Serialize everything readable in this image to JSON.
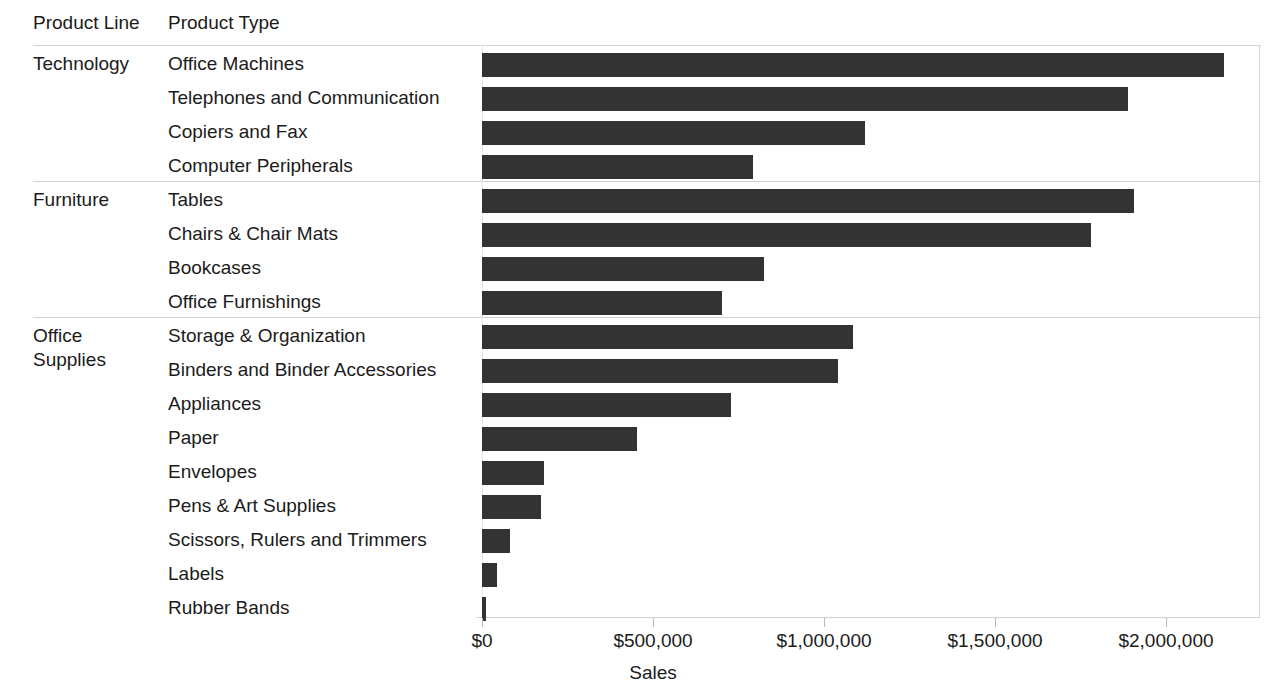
{
  "headers": {
    "product_line": "Product Line",
    "product_type": "Product Type"
  },
  "axis": {
    "title": "Sales",
    "ticks": [
      "$0",
      "$500,000",
      "$1,000,000",
      "$1,500,000",
      "$2,000,000"
    ],
    "tick_values": [
      0,
      500000,
      1000000,
      1500000,
      2000000
    ]
  },
  "colors": {
    "bar": "#333333",
    "rule": "#d4d4d4",
    "text": "#1b1b1b"
  },
  "groups": [
    {
      "name": "Technology",
      "rows": [
        {
          "label": "Office Machines",
          "value": 2170000
        },
        {
          "label": "Telephones and Communication",
          "value": 1888000
        },
        {
          "label": "Copiers and Fax",
          "value": 1120000
        },
        {
          "label": "Computer Peripherals",
          "value": 793000
        }
      ]
    },
    {
      "name": "Furniture",
      "rows": [
        {
          "label": "Tables",
          "value": 1906000
        },
        {
          "label": "Chairs & Chair Mats",
          "value": 1780000
        },
        {
          "label": "Bookcases",
          "value": 824000
        },
        {
          "label": "Office Furnishings",
          "value": 702000
        }
      ]
    },
    {
      "name": "Office Supplies",
      "name_lines": [
        "Office",
        "Supplies"
      ],
      "rows": [
        {
          "label": "Storage & Organization",
          "value": 1085000
        },
        {
          "label": "Binders and Binder Accessories",
          "value": 1042000
        },
        {
          "label": "Appliances",
          "value": 729000
        },
        {
          "label": "Paper",
          "value": 453000
        },
        {
          "label": "Envelopes",
          "value": 181000
        },
        {
          "label": "Pens & Art Supplies",
          "value": 172000
        },
        {
          "label": "Scissors, Rulers and Trimmers",
          "value": 82000
        },
        {
          "label": "Labels",
          "value": 44000
        },
        {
          "label": "Rubber Bands",
          "value": 12000
        }
      ]
    }
  ],
  "chart_data": {
    "type": "bar",
    "orientation": "horizontal",
    "title": "",
    "xlabel": "Sales",
    "ylabel": "",
    "xlim": [
      0,
      2290000
    ],
    "grid": false,
    "legend": null,
    "xtick_labels": [
      "$0",
      "$500,000",
      "$1,000,000",
      "$1,500,000",
      "$2,000,000"
    ],
    "xtick_values": [
      0,
      500000,
      1000000,
      1500000,
      2000000
    ],
    "group_field": "Product Line",
    "category_field": "Product Type",
    "categories": [
      "Office Machines",
      "Telephones and Communication",
      "Copiers and Fax",
      "Computer Peripherals",
      "Tables",
      "Chairs & Chair Mats",
      "Bookcases",
      "Office Furnishings",
      "Storage & Organization",
      "Binders and Binder Accessories",
      "Appliances",
      "Paper",
      "Envelopes",
      "Pens & Art Supplies",
      "Scissors, Rulers and Trimmers",
      "Labels",
      "Rubber Bands"
    ],
    "groups": [
      "Technology",
      "Technology",
      "Technology",
      "Technology",
      "Furniture",
      "Furniture",
      "Furniture",
      "Furniture",
      "Office Supplies",
      "Office Supplies",
      "Office Supplies",
      "Office Supplies",
      "Office Supplies",
      "Office Supplies",
      "Office Supplies",
      "Office Supplies",
      "Office Supplies"
    ],
    "values": [
      2170000,
      1888000,
      1120000,
      793000,
      1906000,
      1780000,
      824000,
      702000,
      1085000,
      1042000,
      729000,
      453000,
      181000,
      172000,
      82000,
      44000,
      12000
    ],
    "bar_color": "#333333"
  }
}
